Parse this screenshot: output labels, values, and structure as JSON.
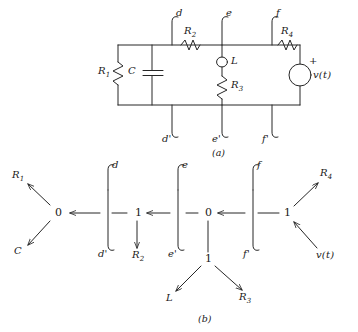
{
  "figure": {
    "caption_a": "(a)",
    "caption_b": "(b)",
    "stroke_color": "#262626",
    "background_color": "#ffffff"
  },
  "circuit": {
    "components": [
      {
        "id": "R1",
        "label": "R",
        "sub": "1",
        "type": "resistor"
      },
      {
        "id": "C",
        "label": "C",
        "sub": "",
        "type": "capacitor"
      },
      {
        "id": "R2",
        "label": "R",
        "sub": "2",
        "type": "resistor"
      },
      {
        "id": "L",
        "label": "L",
        "sub": "",
        "type": "inductor"
      },
      {
        "id": "R3",
        "label": "R",
        "sub": "3",
        "type": "resistor"
      },
      {
        "id": "R4",
        "label": "R",
        "sub": "4",
        "type": "resistor"
      },
      {
        "id": "V",
        "label": "v(t)",
        "sub": "",
        "type": "voltage-source"
      }
    ],
    "source_polarity": "+",
    "terminals_top": [
      "d",
      "e",
      "f"
    ],
    "terminals_bottom": [
      "d'",
      "e'",
      "f'"
    ]
  },
  "bondgraph": {
    "junctions": [
      {
        "id": "j0-left",
        "symbol": "0"
      },
      {
        "id": "j1-left",
        "symbol": "1"
      },
      {
        "id": "j0-center",
        "symbol": "0"
      },
      {
        "id": "j1-bottom",
        "symbol": "1"
      },
      {
        "id": "j1-right",
        "symbol": "1"
      }
    ],
    "elements": [
      {
        "id": "R1",
        "label": "R",
        "sub": "1"
      },
      {
        "id": "C",
        "label": "C",
        "sub": ""
      },
      {
        "id": "R2",
        "label": "R",
        "sub": "2"
      },
      {
        "id": "L",
        "label": "L",
        "sub": ""
      },
      {
        "id": "R3",
        "label": "R",
        "sub": "3"
      },
      {
        "id": "R4",
        "label": "R",
        "sub": "4"
      },
      {
        "id": "V",
        "label": "v(t)",
        "sub": ""
      }
    ],
    "terminals_top": [
      "d",
      "e",
      "f"
    ],
    "terminals_bottom": [
      "d'",
      "e'",
      "f'"
    ]
  }
}
